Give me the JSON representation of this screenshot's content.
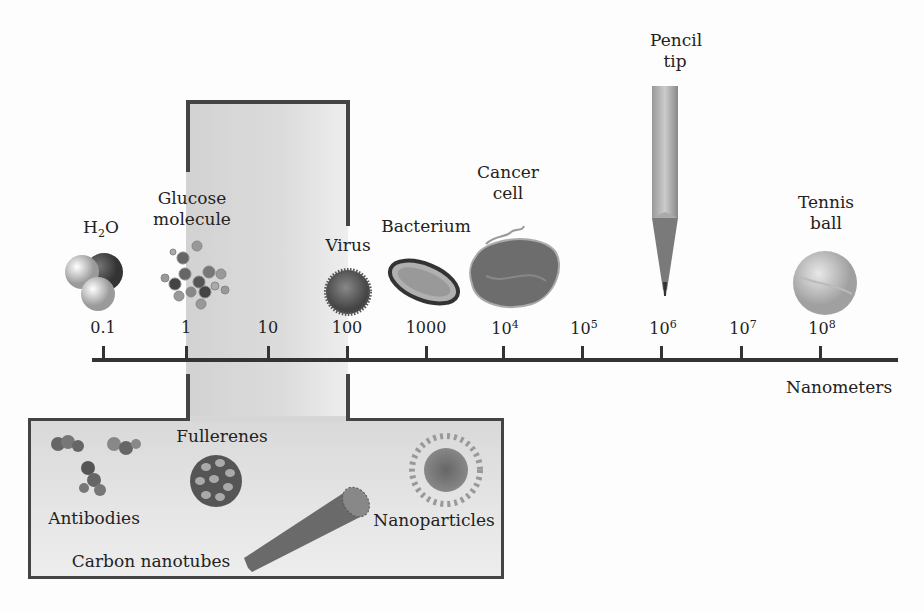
{
  "diagram": {
    "axis_label": "Nanometers",
    "ticks": [
      {
        "base": "0.1",
        "exp": "",
        "x": 103
      },
      {
        "base": "1",
        "exp": "",
        "x": 186
      },
      {
        "base": "10",
        "exp": "",
        "x": 268
      },
      {
        "base": "100",
        "exp": "",
        "x": 347
      },
      {
        "base": "1000",
        "exp": "",
        "x": 426
      },
      {
        "base": "10",
        "exp": "4",
        "x": 503
      },
      {
        "base": "10",
        "exp": "5",
        "x": 582
      },
      {
        "base": "10",
        "exp": "6",
        "x": 661
      },
      {
        "base": "10",
        "exp": "7",
        "x": 741
      },
      {
        "base": "10",
        "exp": "8",
        "x": 820
      }
    ],
    "objects": [
      {
        "name": "water",
        "label_main": "H",
        "label_sub": "2",
        "label_end": "O"
      },
      {
        "name": "glucose",
        "line1": "Glucose",
        "line2": "molecule"
      },
      {
        "name": "virus",
        "label": "Virus"
      },
      {
        "name": "bacterium",
        "label": "Bacterium"
      },
      {
        "name": "cancer-cell",
        "line1": "Cancer",
        "line2": "cell"
      },
      {
        "name": "pencil-tip",
        "line1": "Pencil",
        "line2": "tip"
      },
      {
        "name": "tennis-ball",
        "line1": "Tennis",
        "line2": "ball"
      }
    ],
    "nano_box": {
      "items": [
        {
          "name": "antibodies",
          "label": "Antibodies"
        },
        {
          "name": "fullerenes",
          "label": "Fullerenes"
        },
        {
          "name": "carbon-nanotubes",
          "label": "Carbon nanotubes"
        },
        {
          "name": "nanoparticles",
          "label": "Nanoparticles"
        }
      ]
    }
  }
}
